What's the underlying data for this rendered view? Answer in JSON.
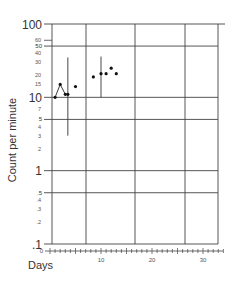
{
  "chart_data": {
    "type": "scatter",
    "title": "",
    "xlabel": "Days",
    "ylabel": "Count per minute",
    "yscale": "log",
    "ylim": [
      0.1,
      100
    ],
    "xlim": [
      0,
      33
    ],
    "grid": true,
    "y_major_ticks": [
      {
        "value": 100,
        "label": "100"
      },
      {
        "value": 50,
        "label": "50"
      },
      {
        "value": 10,
        "label": "10"
      },
      {
        "value": 5,
        "label": "5"
      },
      {
        "value": 1,
        "label": "1"
      },
      {
        "value": 0.5,
        "label": ".5"
      },
      {
        "value": 0.1,
        "label": ".1"
      }
    ],
    "y_minor_ticks": [
      {
        "value": 60,
        "label": "60"
      },
      {
        "value": 40,
        "label": "40"
      },
      {
        "value": 30,
        "label": "30"
      },
      {
        "value": 20,
        "label": "20"
      },
      {
        "value": 15,
        "label": "15"
      },
      {
        "value": 7,
        "label": "7"
      },
      {
        "value": 4,
        "label": "4"
      },
      {
        "value": 3,
        "label": "3"
      },
      {
        "value": 2,
        "label": "2"
      },
      {
        "value": 0.4,
        "label": ".4"
      },
      {
        "value": 0.3,
        "label": ".3"
      },
      {
        "value": 0.2,
        "label": ".2"
      }
    ],
    "x_tick_labels": [
      {
        "value": 0,
        "label": "0"
      },
      {
        "value": 10,
        "label": "10"
      },
      {
        "value": 20,
        "label": "20"
      },
      {
        "value": 30,
        "label": "30"
      }
    ],
    "series": [
      {
        "name": "connected",
        "style": "line+markers",
        "points": [
          [
            1,
            10
          ],
          [
            2,
            15
          ],
          [
            3,
            11
          ],
          [
            3.5,
            11
          ]
        ]
      },
      {
        "name": "points",
        "style": "markers",
        "points": [
          [
            5,
            14
          ],
          [
            8.5,
            19
          ],
          [
            10,
            21
          ],
          [
            11,
            21
          ],
          [
            12,
            25
          ],
          [
            13,
            21
          ]
        ]
      }
    ],
    "range_bars": [
      {
        "x": 3.5,
        "low": 3,
        "high": 35
      },
      {
        "x": 10,
        "low": 10,
        "high": 36
      }
    ]
  }
}
